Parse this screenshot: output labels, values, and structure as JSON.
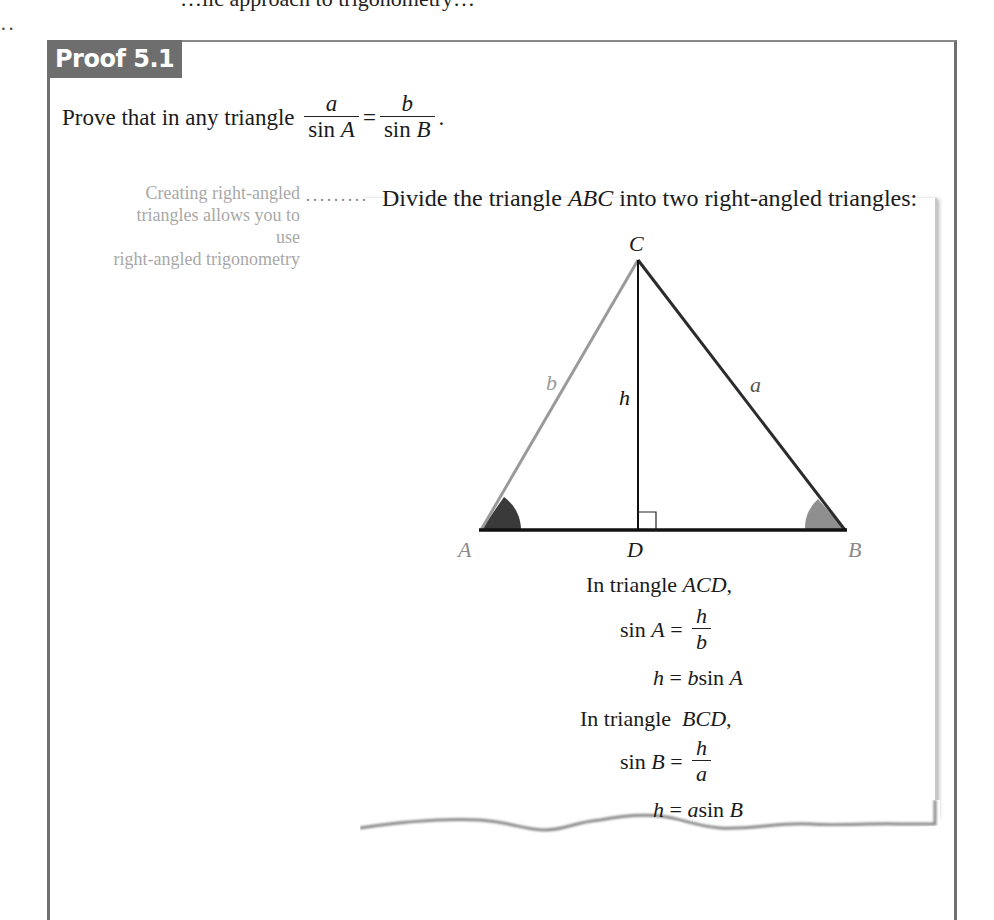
{
  "top_cut_text": "…lic approach to trigonometry…",
  "top_dots": "··",
  "proof": {
    "tab_label": "Proof 5.1",
    "prompt_text": "Prove that in any triangle",
    "lhs_num": "a",
    "lhs_den": "sin A",
    "equals": "=",
    "rhs_num": "b",
    "rhs_den": "sin B",
    "period": "."
  },
  "margin_note": {
    "lines": [
      "Creating right-angled",
      "triangles allows you to use",
      "right-angled trigonometry"
    ],
    "leader": "·········"
  },
  "step1": {
    "pre": "Divide the triangle ",
    "name": "ABC",
    "post": " into two right-angled triangles:"
  },
  "diagram": {
    "vertices": {
      "A": "A",
      "B": "B",
      "C": "C",
      "D": "D"
    },
    "sides": {
      "a": "a",
      "b": "b",
      "h": "h"
    },
    "colors": {
      "side_b": "#9a9a9a",
      "side_a": "#2b2b2b",
      "base": "#111111",
      "altitude": "#111111",
      "angle_A": "#3a3a3a",
      "angle_B": "#8f8f8f",
      "label_A": "#8a8a8a",
      "label_B": "#8a8a8a"
    }
  },
  "derivation": {
    "acd_intro_pre": "In triangle ",
    "acd_name": "ACD",
    "acd_intro_post": ",",
    "sinA_lhs": "sin A =",
    "sinA_num": "h",
    "sinA_den": "b",
    "hA": "h = b sin A",
    "bcd_intro_pre": "In triangle  ",
    "bcd_name": "BCD",
    "bcd_intro_post": ",",
    "sinB_lhs": "sin B =",
    "sinB_num": "h",
    "sinB_den": "a",
    "hB": "h = a sin B"
  }
}
